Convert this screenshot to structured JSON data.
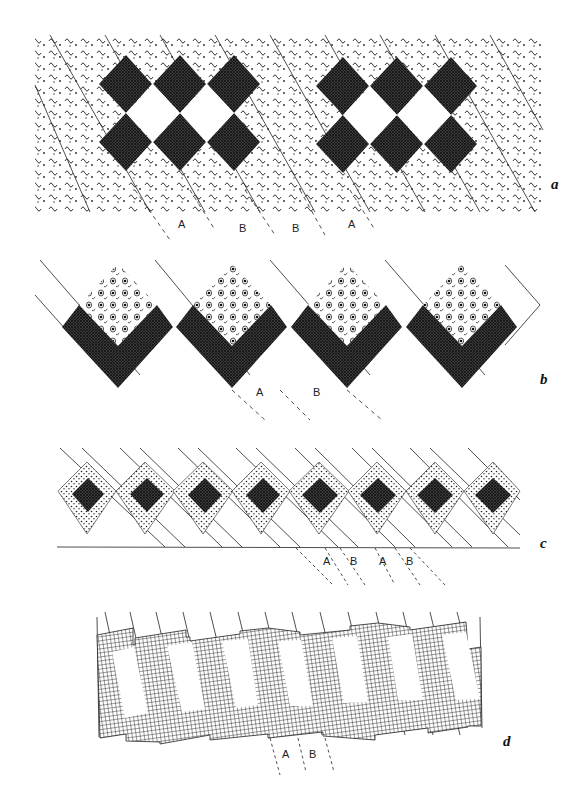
{
  "figure": {
    "ink_color": "#1a1a1a",
    "background": "#ffffff",
    "panels": [
      {
        "id": "a",
        "label": "a",
        "label_pos": [
          551,
          186
        ],
        "description": "Band of wavy-dot texture with diagonal strips; two groups of four cross-hatched diamonds around white diamonds",
        "bbox": [
          35,
          35,
          543,
          212
        ],
        "strip_labels": [
          {
            "text": "A",
            "x": 181,
            "y": 203
          },
          {
            "text": "B",
            "x": 241,
            "y": 208
          },
          {
            "text": "B",
            "x": 293,
            "y": 208
          },
          {
            "text": "A",
            "x": 349,
            "y": 203
          }
        ]
      },
      {
        "id": "b",
        "label": "b",
        "label_pos": [
          540,
          384
        ],
        "description": "Four diamonds: upper half filled with circle-and-tick motif, lower V shape cross-hatched",
        "strip_labels": [
          {
            "text": "A",
            "x": 258,
            "y": 393
          },
          {
            "text": "B",
            "x": 315,
            "y": 393
          }
        ]
      },
      {
        "id": "c",
        "label": "c",
        "label_pos": [
          540,
          548
        ],
        "description": "Eight dark diamonds framed by dotted borders, on diagonal strips above a baseline",
        "strip_labels": [
          {
            "text": "A",
            "x": 323,
            "y": 562
          },
          {
            "text": "B",
            "x": 350,
            "y": 562
          },
          {
            "text": "A",
            "x": 379,
            "y": 562
          },
          {
            "text": "B",
            "x": 406,
            "y": 562
          }
        ]
      },
      {
        "id": "d",
        "label": "d",
        "label_pos": [
          503,
          745
        ],
        "description": "Slanted grid-textured band with seven white rectangular openings, stepped blocks",
        "strip_labels": [
          {
            "text": "A",
            "x": 282,
            "y": 756
          },
          {
            "text": "B",
            "x": 308,
            "y": 756
          }
        ]
      }
    ]
  }
}
